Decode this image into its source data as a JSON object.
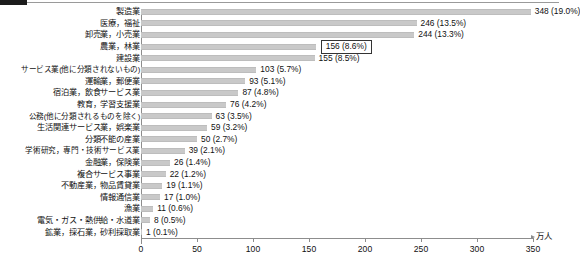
{
  "axis": {
    "unit_label": "万人",
    "ticks": [
      0,
      50,
      100,
      150,
      200,
      250,
      300,
      350
    ],
    "tick_labels": [
      "0",
      "50",
      "100",
      "150",
      "200",
      "250",
      "300",
      "350"
    ]
  },
  "highlight": {
    "category": "農業，林業",
    "value_label": "156 (8.6%)"
  },
  "chart_data": {
    "type": "bar",
    "orientation": "horizontal",
    "title": "",
    "xlabel": "万人",
    "ylabel": "",
    "xlim": [
      0,
      350
    ],
    "grid": false,
    "legend": "none",
    "bar_color": "#c9c9c9",
    "categories": [
      "製造業",
      "医療，福祉",
      "卸売業，小売業",
      "農業，林業",
      "建設業",
      "サービス業(他に分類されないもの)",
      "運輸業，郵便業",
      "宿泊業，飲食サービス業",
      "教育，学習支援業",
      "公務(他に分類されるものを除く)",
      "生活関連サービス業，娯楽業",
      "分類不能の産業",
      "学術研究，専門・技術サービス業",
      "金融業，保険業",
      "複合サービス事業",
      "不動産業，物品賃貸業",
      "情報通信業",
      "漁業",
      "電気・ガス・熱供給・水道業",
      "鉱業，採石業，砂利採取業"
    ],
    "values": [
      348,
      246,
      244,
      156,
      155,
      103,
      93,
      87,
      76,
      63,
      59,
      50,
      39,
      26,
      22,
      19,
      17,
      11,
      8,
      1
    ],
    "percents": [
      "19.0%",
      "13.5%",
      "13.3%",
      "8.6%",
      "8.5%",
      "5.7%",
      "5.1%",
      "4.8%",
      "4.2%",
      "3.5%",
      "3.2%",
      "2.7%",
      "2.1%",
      "1.4%",
      "1.2%",
      "1.1%",
      "1.0%",
      "0.6%",
      "0.5%",
      "0.1%"
    ],
    "data_labels": [
      "348 (19.0%)",
      "246 (13.5%)",
      "244 (13.3%)",
      "156 (8.6%)",
      "155 (8.5%)",
      "103 (5.7%)",
      "93 (5.1%)",
      "87 (4.8%)",
      "76 (4.2%)",
      "63 (3.5%)",
      "59 (3.2%)",
      "50 (2.7%)",
      "39 (2.1%)",
      "26 (1.4%)",
      "22 (1.2%)",
      "19 (1.1%)",
      "17 (1.0%)",
      "11 (0.6%)",
      "8 (0.5%)",
      "1 (0.1%)"
    ]
  }
}
